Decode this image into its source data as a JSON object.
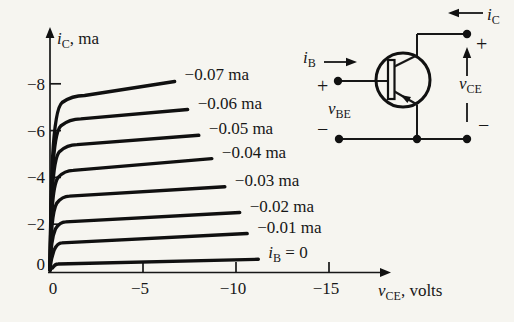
{
  "figure": {
    "background": "#f6f5f0",
    "ink": "#171717"
  },
  "chart_data": {
    "type": "line",
    "title": "",
    "xlabel": "v_CE, volts",
    "ylabel": "i_C, ma",
    "xlabel_parts": {
      "base": "v",
      "sub": "CE",
      "rest": ", volts"
    },
    "ylabel_parts": {
      "base": "i",
      "sub": "C",
      "rest": ", ma"
    },
    "xlim": [
      0,
      -18
    ],
    "ylim": [
      0,
      -10.5
    ],
    "grid": false,
    "legend_position": "curve-end-labels",
    "x_origin_label": "0",
    "y_origin_label": "0",
    "x_ticks": [
      {
        "v": -5,
        "label": "−5"
      },
      {
        "v": -10,
        "label": "−10"
      },
      {
        "v": -15,
        "label": "−15"
      }
    ],
    "y_ticks": [
      {
        "v": -2,
        "label": "−2"
      },
      {
        "v": -4,
        "label": "−4"
      },
      {
        "v": -6,
        "label": "−6"
      },
      {
        "v": -8,
        "label": "−8"
      }
    ],
    "series": [
      {
        "i_b_ma": -0.07,
        "label": "−0.07 ma",
        "knee_ma": -7.5,
        "end_ma": -8.1,
        "end_v": -6.7
      },
      {
        "i_b_ma": -0.06,
        "label": "−0.06 ma",
        "knee_ma": -6.5,
        "end_ma": -6.9,
        "end_v": -7.4
      },
      {
        "i_b_ma": -0.05,
        "label": "−0.05 ma",
        "knee_ma": -5.4,
        "end_ma": -5.8,
        "end_v": -8.0
      },
      {
        "i_b_ma": -0.04,
        "label": "−0.04 ma",
        "knee_ma": -4.3,
        "end_ma": -4.8,
        "end_v": -8.7
      },
      {
        "i_b_ma": -0.03,
        "label": "−0.03 ma",
        "knee_ma": -3.2,
        "end_ma": -3.6,
        "end_v": -9.4
      },
      {
        "i_b_ma": -0.02,
        "label": "−0.02 ma",
        "knee_ma": -2.1,
        "end_ma": -2.5,
        "end_v": -10.2
      },
      {
        "i_b_ma": -0.01,
        "label": "−0.01 ma",
        "knee_ma": -1.2,
        "end_ma": -1.6,
        "end_v": -10.6
      },
      {
        "i_b_ma": 0,
        "label_parts": {
          "base": "i",
          "sub": "B",
          "rest": " = 0"
        },
        "knee_ma": -0.3,
        "end_ma": -0.5,
        "end_v": -11.2
      }
    ]
  },
  "circuit": {
    "description": "pnp transistor common-emitter measurement circuit",
    "labels": {
      "ic": {
        "base": "i",
        "sub": "C"
      },
      "ib": {
        "base": "i",
        "sub": "B"
      },
      "vbe": {
        "base": "v",
        "sub": "BE"
      },
      "vce": {
        "base": "v",
        "sub": "CE"
      },
      "plus_left": "+",
      "minus_left": "−",
      "plus_top_right": "+",
      "minus_bottom_right": "−"
    }
  }
}
